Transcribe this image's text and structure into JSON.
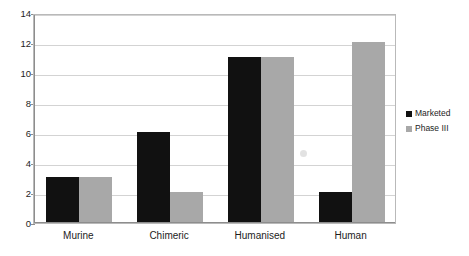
{
  "chart_data": {
    "type": "bar",
    "title": "",
    "subtitle": "",
    "xlabel": "",
    "ylabel": "",
    "categories": [
      "Murine",
      "Chimeric",
      "Humanised",
      "Human"
    ],
    "series": [
      {
        "name": "Marketed",
        "color": "#111111",
        "values": [
          3,
          6,
          11,
          2
        ]
      },
      {
        "name": "Phase III",
        "color": "#a8a8a8",
        "values": [
          3,
          2,
          11,
          12
        ]
      }
    ],
    "ylim": [
      0,
      14
    ],
    "ytick_step": 2,
    "yticks": [
      "0",
      "2",
      "4",
      "6",
      "8",
      "10",
      "12",
      "14"
    ],
    "grid": true,
    "grid_axis": "y",
    "legend_position": "right",
    "plot_border": true,
    "background_color": "#ffffff",
    "grid_color": "#d3d3d3",
    "axis_color": "#8d8d8d"
  },
  "legend": {
    "items": [
      {
        "label": "Marketed",
        "color": "#111111"
      },
      {
        "label": "Phase III",
        "color": "#a8a8a8"
      }
    ]
  }
}
